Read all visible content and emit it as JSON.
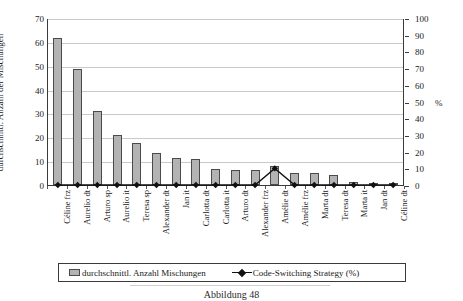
{
  "chart_data": {
    "type": "bar",
    "title": "",
    "subtitle": "",
    "xlabel": "",
    "ylabel": "durchschnittl. Anzahl der Mischungen",
    "y2label": "%",
    "ylim": [
      0,
      70
    ],
    "y2lim": [
      0,
      100
    ],
    "yticks": [
      0,
      10,
      20,
      30,
      40,
      50,
      60,
      70
    ],
    "y2ticks": [
      0,
      10,
      20,
      30,
      40,
      50,
      60,
      70,
      80,
      90,
      100
    ],
    "grid": true,
    "legend_position": "bottom",
    "categories": [
      "Céline frz",
      "Aurelio dt",
      "Arturo sp",
      "Aurelio it",
      "Teresa sp",
      "Alexander dt",
      "Jan it",
      "Carlotta dt",
      "Carlotta it",
      "Arturo dt",
      "Alexander frz",
      "Amélie dt",
      "Amélie frz",
      "Marta dt",
      "Teresa dt",
      "Marta it",
      "Jan dt",
      "Céline dt"
    ],
    "series": [
      {
        "name": "durchschnittl. Anzahl Mischungen",
        "type": "bar",
        "axis": "left",
        "color": "#b3b3b3",
        "edge_color": "#4a4a4a",
        "values": [
          61.5,
          48.8,
          31.2,
          21.0,
          17.5,
          13.4,
          11.2,
          11.0,
          6.6,
          6.5,
          6.4,
          7.8,
          5.2,
          5.0,
          4.4,
          1.1,
          0.6,
          0.3
        ]
      },
      {
        "name": "Code-Switching Strategy (%)",
        "type": "line",
        "axis": "right",
        "color": "#111111",
        "marker": "diamond",
        "values": [
          0,
          0,
          0,
          0,
          0,
          0,
          0,
          0,
          0,
          0,
          0,
          10,
          0,
          0,
          0,
          0,
          0,
          0
        ]
      }
    ]
  },
  "legend": {
    "bar_label": "durchschnittl. Anzahl Mischungen",
    "line_label": "Code-Switching Strategy (%)"
  },
  "caption": {
    "text": "Abbildung 48"
  }
}
